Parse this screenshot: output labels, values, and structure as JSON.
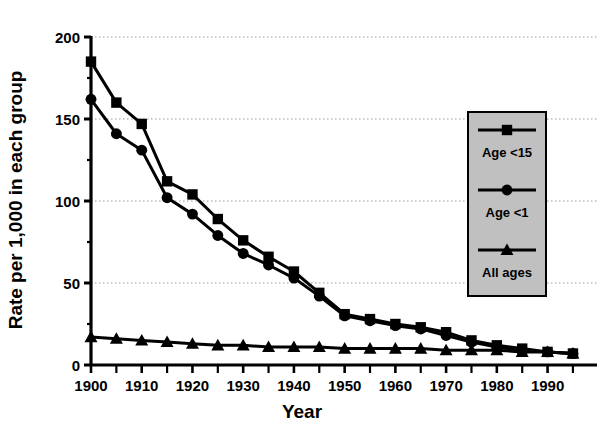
{
  "chart_data": {
    "type": "line",
    "title": "",
    "xlabel": "Year",
    "ylabel": "Rate per 1,000 in each group",
    "xlim": [
      1900,
      1996
    ],
    "ylim": [
      0,
      200
    ],
    "yticks": [
      0,
      50,
      100,
      150,
      200
    ],
    "xticks": [
      1900,
      1910,
      1920,
      1930,
      1940,
      1950,
      1960,
      1970,
      1980,
      1990
    ],
    "xtick_labels": [
      "1900",
      "1910",
      "1920",
      "1930",
      "1940",
      "1950",
      "1960",
      "1970",
      "1980",
      "1990"
    ],
    "ytick_labels": [
      "0",
      "50",
      "100",
      "150",
      "200"
    ],
    "minor_xtick_interval": 5,
    "grid": "horizontal-dotted",
    "legend_position": "right-middle",
    "x": [
      1900,
      1905,
      1910,
      1915,
      1920,
      1925,
      1930,
      1935,
      1940,
      1945,
      1950,
      1955,
      1960,
      1965,
      1970,
      1975,
      1980,
      1985,
      1990,
      1995
    ],
    "series": [
      {
        "name": "Age <15",
        "marker": "square",
        "color": "#000000",
        "values": [
          185,
          160,
          147,
          112,
          104,
          89,
          76,
          66,
          57,
          44,
          31,
          28,
          25,
          23,
          20,
          15,
          12,
          10,
          8,
          7
        ]
      },
      {
        "name": "Age <1",
        "marker": "circle",
        "color": "#000000",
        "values": [
          162,
          141,
          131,
          102,
          92,
          79,
          68,
          61,
          53,
          42,
          30,
          27,
          24,
          22,
          18,
          14,
          11,
          9,
          8,
          7
        ]
      },
      {
        "name": "All ages",
        "marker": "triangle",
        "color": "#000000",
        "values": [
          17,
          16,
          15,
          14,
          13,
          12,
          12,
          11,
          11,
          11,
          10,
          10,
          10,
          10,
          9,
          9,
          9,
          8,
          8,
          7
        ]
      }
    ]
  },
  "legend": {
    "entries": [
      {
        "label": "Age <15",
        "marker": "square"
      },
      {
        "label": "Age <1",
        "marker": "circle"
      },
      {
        "label": "All ages",
        "marker": "triangle"
      }
    ],
    "background": "#c0c0c0",
    "border": "#000000"
  },
  "axes": {
    "y_title": "Rate per 1,000 in each group",
    "x_title": "Year"
  }
}
